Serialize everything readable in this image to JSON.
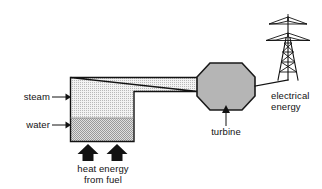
{
  "diagram": {
    "background_color": "#ffffff",
    "ink_color": "#121212"
  },
  "labels": {
    "steam": "steam",
    "water": "water",
    "turbine": "turbine",
    "heat_energy_line1": "heat energy",
    "heat_energy_line2": "from fuel",
    "electrical_line1": "electrical",
    "electrical_line2": "energy"
  },
  "components": {
    "boiler": {
      "name": "boiler",
      "x": 70,
      "y": 77,
      "width": 64,
      "height": 65,
      "steam_fill": "#e9e9e9",
      "water_fill": "#c9c9c9",
      "water_level_y": 118,
      "border_color": "#333333"
    },
    "steam_pipe": {
      "name": "steam-pipe",
      "fill": "#e3e3e3",
      "from_x": 134,
      "to_x": 198,
      "top_y": 77,
      "bottom_y": 92
    },
    "turbine": {
      "name": "turbine",
      "shape": "octagon",
      "center_x": 226,
      "center_y": 86,
      "width": 58,
      "height": 47,
      "fill": "#b5b5b5",
      "border_color": "#1a1a1a"
    },
    "pylon": {
      "name": "electricity-pylon",
      "base_x": 288,
      "base_y": 80,
      "top_y": 16,
      "crossarm_count": 2
    },
    "power_line": {
      "name": "power-line",
      "from_x": 255,
      "from_y": 86,
      "to_x": 288,
      "to_y": 80
    },
    "heat_arrows": {
      "name": "heat-energy-arrows",
      "count": 2,
      "fill": "#121212",
      "positions": [
        88,
        117
      ],
      "tip_y": 145,
      "base_y": 161
    }
  }
}
